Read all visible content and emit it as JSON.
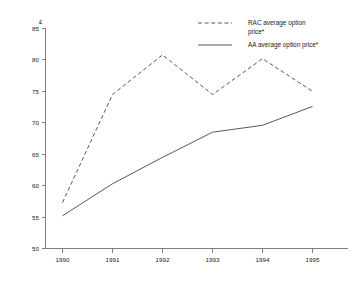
{
  "chart_data": {
    "type": "line",
    "title": "",
    "subtitle": "",
    "xlabel": "",
    "ylabel": "£",
    "y_unit_symbol": "£",
    "categories": [
      "1990",
      "1991",
      "1992",
      "1993",
      "1994",
      "1995"
    ],
    "x": [
      1990,
      1991,
      1992,
      1993,
      1994,
      1995
    ],
    "xlim": [
      1990,
      1995
    ],
    "ylim": [
      50,
      85
    ],
    "y_ticks": [
      "85",
      "80",
      "75",
      "70",
      "65",
      "60",
      "55",
      "50"
    ],
    "y_tick_values": [
      85,
      80,
      75,
      70,
      65,
      60,
      55,
      50
    ],
    "x_ticks": [
      "1990",
      "1991",
      "1992",
      "1993",
      "1994",
      "1995"
    ],
    "grid": false,
    "legend_position": "top-right",
    "series": [
      {
        "name": "RAC average option price*",
        "style": "dashed",
        "color": "#3a3a3a",
        "values": [
          57.3,
          74.5,
          80.8,
          74.5,
          80.2,
          75.0
        ]
      },
      {
        "name": "AA average option price*",
        "style": "solid",
        "color": "#3a3a3a",
        "values": [
          55.2,
          60.3,
          64.5,
          68.5,
          69.6,
          72.6
        ]
      }
    ]
  },
  "axes": {
    "y_unit": "£",
    "y_tick_labels": [
      "85",
      "80",
      "75",
      "70",
      "65",
      "60",
      "55",
      "50"
    ],
    "x_tick_labels": [
      "1990",
      "1991",
      "1992",
      "1993",
      "1994",
      "1995"
    ]
  },
  "legend": {
    "entries": [
      {
        "label_line1": "RAC average option",
        "label_line2": "price*",
        "full_label": "RAC average option price*",
        "style": "dashed"
      },
      {
        "label_line1": "AA average option price*",
        "label_line2": "",
        "full_label": "AA average option price*",
        "style": "solid"
      }
    ]
  }
}
